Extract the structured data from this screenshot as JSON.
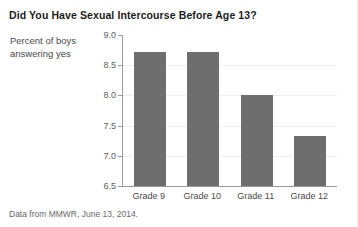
{
  "chart_data": {
    "type": "bar",
    "title": "Did You Have Sexual Intercourse Before Age 13?",
    "subtitle": "",
    "xlabel": "",
    "ylabel": "Percent of boys answering yes",
    "ylabel_lines": [
      "Percent of boys",
      "answering yes"
    ],
    "categories": [
      "Grade 9",
      "Grade 10",
      "Grade 11",
      "Grade 12"
    ],
    "values": [
      8.72,
      8.72,
      8.0,
      7.33
    ],
    "ylim": [
      6.5,
      9.0
    ],
    "yticks": [
      "9.0",
      "8.5",
      "8.0",
      "7.5",
      "7.0",
      "6.5"
    ],
    "ytick_values": [
      9.0,
      8.5,
      8.0,
      7.5,
      7.0,
      6.5
    ],
    "grid": true,
    "legend": false,
    "bar_color": "#6e6e6e",
    "gridline_color": "#eeeeee",
    "axis_color": "#9a9a9a",
    "background_color": "#ffffff",
    "source_note": "Data from MMWR, June 13, 2014."
  }
}
